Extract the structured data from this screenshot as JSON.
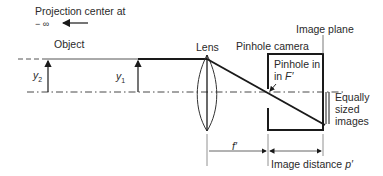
{
  "diagram": {
    "labels": {
      "projection_center": "Projection center at",
      "minus_infinity": "− ∞",
      "object": "Object",
      "lens": "Lens",
      "pinhole_camera": "Pinhole camera",
      "image_plane": "Image plane",
      "pinhole_in": "Pinhole in",
      "in_f_prime_prefix": "in ",
      "f_prime": "F′",
      "equally": "Equally",
      "sized": "sized",
      "images": "images",
      "y2": "y",
      "y2_sub": "2",
      "y1": "y",
      "y1_sub": "1",
      "focal_length": "f′",
      "image_distance": "Image distance ",
      "image_distance_symbol": "p′"
    },
    "colors": {
      "line": "#1a1a1a",
      "thin_line": "#555555",
      "background": "#ffffff"
    }
  }
}
